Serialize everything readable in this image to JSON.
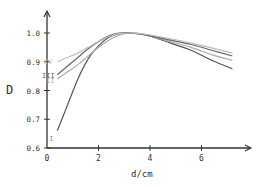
{
  "chart_data": {
    "type": "line",
    "title": "",
    "xlabel": "d/cm",
    "ylabel": "D",
    "xlim": [
      0,
      7.8
    ],
    "ylim": [
      0.6,
      1.05
    ],
    "x_ticks": [
      0,
      2,
      4,
      6
    ],
    "x_tick_labels": [
      "0",
      "2",
      "4",
      "6"
    ],
    "y_ticks": [
      0.6,
      0.7,
      0.8,
      0.9,
      1.0
    ],
    "y_tick_labels": [
      "0.6",
      "0.7",
      "0.8",
      "0.9",
      "1.0"
    ],
    "grid": false,
    "legend": "inline labels at left end of curves",
    "series": [
      {
        "name": "I",
        "color": "#555555",
        "x": [
          0.4,
          0.8,
          1.2,
          1.6,
          2.0,
          2.4,
          2.8,
          3.2,
          3.6,
          4.0,
          4.8,
          5.6,
          6.4,
          7.2
        ],
        "y": [
          0.66,
          0.75,
          0.84,
          0.91,
          0.955,
          0.985,
          0.998,
          1.0,
          0.998,
          0.99,
          0.965,
          0.94,
          0.905,
          0.875
        ]
      },
      {
        "name": "II",
        "color": "#aaaaaa",
        "x": [
          0.4,
          0.8,
          1.2,
          1.6,
          2.0,
          2.4,
          2.8,
          3.2,
          3.6,
          4.0,
          4.8,
          5.6,
          6.4,
          7.2
        ],
        "y": [
          0.84,
          0.865,
          0.89,
          0.92,
          0.95,
          0.975,
          0.992,
          1.0,
          0.998,
          0.99,
          0.97,
          0.95,
          0.925,
          0.905
        ]
      },
      {
        "name": "III",
        "color": "#666666",
        "x": [
          0.4,
          0.8,
          1.2,
          1.6,
          2.0,
          2.4,
          2.8,
          3.2,
          3.6,
          4.0,
          4.8,
          5.6,
          6.4,
          7.2
        ],
        "y": [
          0.855,
          0.885,
          0.915,
          0.945,
          0.97,
          0.99,
          1.0,
          1.0,
          0.996,
          0.99,
          0.975,
          0.96,
          0.94,
          0.92
        ]
      },
      {
        "name": "IV",
        "color": "#bbbbbb",
        "x": [
          0.4,
          0.8,
          1.2,
          1.6,
          2.0,
          2.4,
          2.8,
          3.2,
          3.6,
          4.0,
          4.8,
          5.6,
          6.4,
          7.2
        ],
        "y": [
          0.9,
          0.915,
          0.93,
          0.95,
          0.97,
          0.988,
          0.998,
          1.0,
          0.998,
          0.993,
          0.98,
          0.965,
          0.948,
          0.93
        ]
      }
    ]
  },
  "axes": {
    "x_label": "d/cm",
    "y_label": "D"
  }
}
